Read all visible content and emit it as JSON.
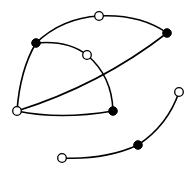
{
  "diagram": {
    "type": "graph",
    "colors": {
      "stroke": "#000000",
      "filled": "#000000",
      "hollow_fill": "#ffffff",
      "background": "#ffffff"
    },
    "node_radius": 4.3,
    "nodes": [
      {
        "id": "n1",
        "kind": "filled",
        "x": 36,
        "y": 43
      },
      {
        "id": "n2",
        "kind": "hollow",
        "x": 99,
        "y": 16
      },
      {
        "id": "n3",
        "kind": "filled",
        "x": 167,
        "y": 33
      },
      {
        "id": "n4",
        "kind": "hollow",
        "x": 87,
        "y": 55
      },
      {
        "id": "n5",
        "kind": "hollow",
        "x": 17,
        "y": 111
      },
      {
        "id": "n6",
        "kind": "filled",
        "x": 113,
        "y": 111
      },
      {
        "id": "n7",
        "kind": "hollow",
        "x": 62,
        "y": 158
      },
      {
        "id": "n8",
        "kind": "filled",
        "x": 138,
        "y": 145
      },
      {
        "id": "n9",
        "kind": "hollow",
        "x": 179,
        "y": 92
      }
    ],
    "edges": [
      {
        "id": "e1",
        "from": "n1",
        "to": "n3",
        "via": "n2",
        "d": "M36,43 Q62,18 99,16 Q140,14 167,33"
      },
      {
        "id": "e2",
        "from": "n1",
        "to": "n6",
        "via": "n4",
        "d": "M36,43 Q68,40 87,55 Q112,76 113,111"
      },
      {
        "id": "e3",
        "from": "n1",
        "to": "n5",
        "d": "M36,43 Q20,70 17,111"
      },
      {
        "id": "e4",
        "from": "n5",
        "to": "n3",
        "d": "M17,111 Q100,85 167,33"
      },
      {
        "id": "e5",
        "from": "n5",
        "to": "n6",
        "d": "M17,111 Q60,120 113,111"
      },
      {
        "id": "e6",
        "from": "n7",
        "to": "n9",
        "via": "n8",
        "d": "M62,158 Q105,160 138,145 Q168,125 179,92"
      }
    ]
  }
}
